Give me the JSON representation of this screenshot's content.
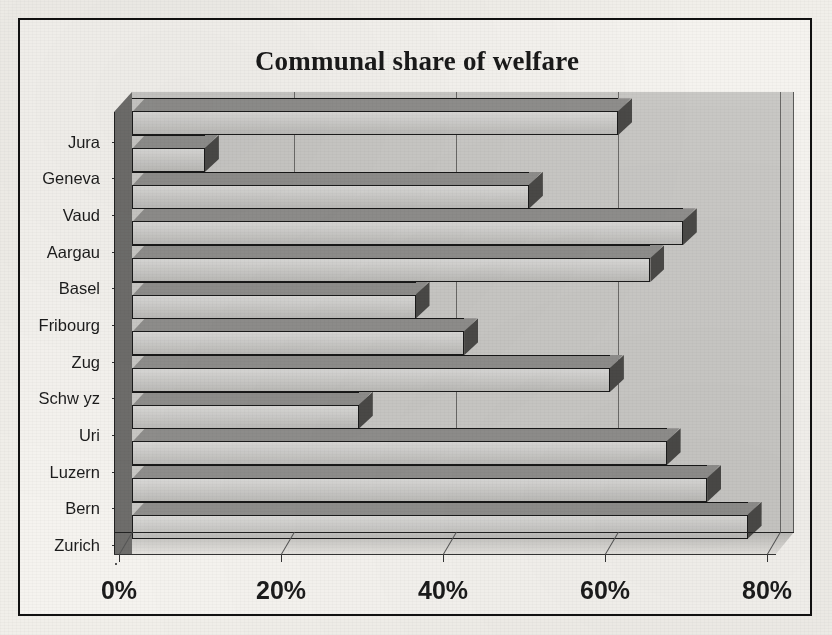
{
  "chart": {
    "title": "Communal share of welfare",
    "type_label": "3d-horizontal-bar"
  },
  "chart_data": {
    "type": "bar",
    "orientation": "horizontal",
    "style": "3d",
    "title": "Communal share of welfare",
    "xlabel": "",
    "ylabel": "",
    "categories": [
      "Zurich",
      "Bern",
      "Luzern",
      "Uri",
      "Schwyz",
      "Zug",
      "Fribourg",
      "Basel",
      "Aargau",
      "Vaud",
      "Geneva",
      "Jura"
    ],
    "values": [
      76,
      71,
      66,
      28,
      59,
      41,
      35,
      64,
      68,
      49,
      9,
      60
    ],
    "value_unit": "%",
    "xlim": [
      0,
      80
    ],
    "xticks": [
      0,
      20,
      40,
      60,
      80
    ],
    "xtick_labels": [
      "0%",
      "20%",
      "40%",
      "60%",
      "80%"
    ],
    "grid": "vertical",
    "legend": "none",
    "series": [
      {
        "name": "Communal share of welfare",
        "values": [
          76,
          71,
          66,
          28,
          59,
          41,
          35,
          64,
          68,
          49,
          9,
          60
        ]
      }
    ],
    "bars_top_to_bottom": [
      {
        "label": "",
        "value": 60
      },
      {
        "label": "Jura",
        "value": 9
      },
      {
        "label": "Geneva",
        "value": 49
      },
      {
        "label": "Vaud",
        "value": 68
      },
      {
        "label": "Aargau",
        "value": 64
      },
      {
        "label": "Basel",
        "value": 35
      },
      {
        "label": "Fribourg",
        "value": 41
      },
      {
        "label": "Zug",
        "value": 59
      },
      {
        "label": "Schwyz",
        "value": 28
      },
      {
        "label": "Uri",
        "value": 66
      },
      {
        "label": "Luzern",
        "value": 71
      },
      {
        "label": "Bern",
        "value": 76
      }
    ]
  },
  "axis": {
    "x_tick_labels": [
      "0%",
      "20%",
      "40%",
      "60%",
      "80%"
    ]
  },
  "categories_display": [
    "Jura",
    "Geneva",
    "Vaud",
    "Aargau",
    "Basel",
    "Fribourg",
    "Zug",
    "Schw yz",
    "Uri",
    "Luzern",
    "Bern",
    "Zurich"
  ],
  "colors": {
    "bar_face": "#c6c5c2",
    "bar_top": "#8f8e8c",
    "bar_side": "#4a4947",
    "plot_background": "#c9c8c5",
    "page_background": "#f1efea",
    "outline": "#1b1b1b",
    "text": "#1c1c1c"
  }
}
